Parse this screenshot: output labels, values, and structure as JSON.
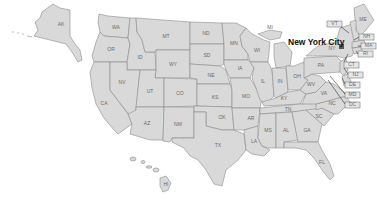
{
  "map": {
    "title": "United States",
    "highlight": {
      "label": "New York City",
      "state": "NY",
      "marker_color": "#555555"
    },
    "colors": {
      "state_fill": "#d9d9d9",
      "state_stroke": "#8c8c8c",
      "label": "#6a6a6a",
      "background": "#ffffff"
    },
    "states": [
      {
        "abbr": "AK"
      },
      {
        "abbr": "WA"
      },
      {
        "abbr": "OR"
      },
      {
        "abbr": "CA"
      },
      {
        "abbr": "ID"
      },
      {
        "abbr": "NV"
      },
      {
        "abbr": "MT"
      },
      {
        "abbr": "WY"
      },
      {
        "abbr": "UT"
      },
      {
        "abbr": "AZ"
      },
      {
        "abbr": "CO"
      },
      {
        "abbr": "NM"
      },
      {
        "abbr": "ND"
      },
      {
        "abbr": "SD"
      },
      {
        "abbr": "NE"
      },
      {
        "abbr": "KS"
      },
      {
        "abbr": "OK"
      },
      {
        "abbr": "TX"
      },
      {
        "abbr": "MN"
      },
      {
        "abbr": "IA"
      },
      {
        "abbr": "MO"
      },
      {
        "abbr": "AR"
      },
      {
        "abbr": "LA"
      },
      {
        "abbr": "WI"
      },
      {
        "abbr": "IL"
      },
      {
        "abbr": "MI"
      },
      {
        "abbr": "IN"
      },
      {
        "abbr": "OH"
      },
      {
        "abbr": "KY"
      },
      {
        "abbr": "TN"
      },
      {
        "abbr": "MS"
      },
      {
        "abbr": "AL"
      },
      {
        "abbr": "GA"
      },
      {
        "abbr": "FL"
      },
      {
        "abbr": "SC"
      },
      {
        "abbr": "NC"
      },
      {
        "abbr": "VA"
      },
      {
        "abbr": "WV"
      },
      {
        "abbr": "PA"
      },
      {
        "abbr": "NY"
      },
      {
        "abbr": "ME"
      },
      {
        "abbr": "HI"
      }
    ],
    "callout_states": [
      "VT",
      "NH",
      "MA",
      "RI",
      "CT",
      "NJ",
      "DE",
      "MD",
      "DC"
    ]
  }
}
